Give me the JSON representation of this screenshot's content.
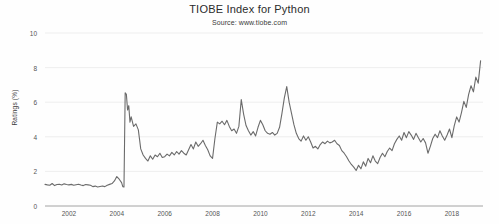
{
  "chart_data": {
    "type": "line",
    "title": "TIOBE Index for Python",
    "subtitle": "Source: www.tiobe.com",
    "xlabel": "",
    "ylabel": "Ratings (%)",
    "ylim": [
      0,
      10
    ],
    "xlim": [
      2001.0,
      2019.3
    ],
    "yticks": [
      0,
      2,
      4,
      6,
      8,
      10
    ],
    "ytick_labels": [
      "0",
      "2",
      "4",
      "6",
      "8",
      "10"
    ],
    "xticks": [
      2002,
      2004,
      2006,
      2008,
      2010,
      2012,
      2014,
      2016,
      2018
    ],
    "xtick_labels": [
      "2002",
      "2004",
      "2006",
      "2008",
      "2010",
      "2012",
      "2014",
      "2016",
      "2018"
    ],
    "grid": "horizontal",
    "legend": "none",
    "series": [
      {
        "name": "Python",
        "color": "#6b6b6b",
        "x": [
          2001.0,
          2001.1,
          2001.2,
          2001.3,
          2001.4,
          2001.5,
          2001.6,
          2001.7,
          2001.8,
          2001.9,
          2002.0,
          2002.1,
          2002.2,
          2002.3,
          2002.4,
          2002.5,
          2002.6,
          2002.7,
          2002.8,
          2002.9,
          2003.0,
          2003.1,
          2003.2,
          2003.3,
          2003.4,
          2003.5,
          2003.6,
          2003.7,
          2003.8,
          2003.9,
          2004.0,
          2004.1,
          2004.2,
          2004.25,
          2004.3,
          2004.35,
          2004.4,
          2004.45,
          2004.5,
          2004.55,
          2004.6,
          2004.7,
          2004.8,
          2004.9,
          2005.0,
          2005.1,
          2005.2,
          2005.3,
          2005.4,
          2005.5,
          2005.6,
          2005.7,
          2005.8,
          2005.9,
          2006.0,
          2006.1,
          2006.2,
          2006.3,
          2006.4,
          2006.5,
          2006.6,
          2006.7,
          2006.8,
          2006.9,
          2007.0,
          2007.1,
          2007.2,
          2007.3,
          2007.4,
          2007.5,
          2007.6,
          2007.7,
          2007.8,
          2007.9,
          2008.0,
          2008.1,
          2008.2,
          2008.3,
          2008.4,
          2008.5,
          2008.6,
          2008.7,
          2008.8,
          2008.9,
          2009.0,
          2009.1,
          2009.2,
          2009.3,
          2009.4,
          2009.5,
          2009.6,
          2009.7,
          2009.8,
          2009.9,
          2010.0,
          2010.1,
          2010.2,
          2010.3,
          2010.4,
          2010.5,
          2010.6,
          2010.7,
          2010.8,
          2010.9,
          2011.0,
          2011.1,
          2011.2,
          2011.3,
          2011.4,
          2011.5,
          2011.6,
          2011.7,
          2011.8,
          2011.9,
          2012.0,
          2012.1,
          2012.2,
          2012.3,
          2012.4,
          2012.5,
          2012.6,
          2012.7,
          2012.8,
          2012.9,
          2013.0,
          2013.1,
          2013.2,
          2013.3,
          2013.4,
          2013.5,
          2013.6,
          2013.7,
          2013.8,
          2013.9,
          2014.0,
          2014.1,
          2014.2,
          2014.3,
          2014.4,
          2014.5,
          2014.6,
          2014.7,
          2014.8,
          2014.9,
          2015.0,
          2015.1,
          2015.2,
          2015.3,
          2015.4,
          2015.5,
          2015.6,
          2015.7,
          2015.8,
          2015.9,
          2016.0,
          2016.1,
          2016.2,
          2016.3,
          2016.4,
          2016.5,
          2016.6,
          2016.7,
          2016.8,
          2016.9,
          2017.0,
          2017.1,
          2017.2,
          2017.3,
          2017.4,
          2017.5,
          2017.6,
          2017.7,
          2017.8,
          2017.9,
          2018.0,
          2018.1,
          2018.2,
          2018.3,
          2018.4,
          2018.5,
          2018.6,
          2018.7,
          2018.8,
          2018.9,
          2019.0,
          2019.1,
          2019.2
        ],
        "y": [
          1.25,
          1.22,
          1.2,
          1.3,
          1.18,
          1.24,
          1.26,
          1.21,
          1.28,
          1.24,
          1.22,
          1.25,
          1.2,
          1.23,
          1.26,
          1.21,
          1.18,
          1.24,
          1.22,
          1.2,
          1.12,
          1.15,
          1.1,
          1.13,
          1.16,
          1.12,
          1.2,
          1.25,
          1.3,
          1.45,
          1.7,
          1.55,
          1.35,
          1.12,
          1.1,
          6.55,
          6.45,
          5.55,
          5.8,
          4.85,
          5.15,
          4.6,
          4.75,
          4.4,
          3.3,
          2.95,
          2.75,
          2.6,
          2.9,
          2.7,
          2.95,
          2.85,
          3.05,
          2.8,
          2.85,
          3.0,
          2.9,
          3.1,
          2.95,
          3.15,
          3.0,
          3.2,
          3.05,
          2.95,
          3.25,
          3.55,
          3.3,
          3.7,
          3.45,
          3.6,
          3.8,
          3.5,
          3.25,
          2.9,
          2.75,
          3.9,
          4.85,
          4.75,
          4.9,
          4.7,
          4.95,
          4.6,
          4.35,
          4.45,
          4.2,
          4.6,
          6.15,
          5.3,
          4.65,
          4.35,
          4.1,
          4.3,
          4.05,
          4.55,
          4.95,
          4.7,
          4.35,
          4.2,
          4.15,
          4.25,
          4.1,
          4.2,
          4.55,
          5.35,
          6.25,
          6.9,
          6.0,
          5.35,
          4.7,
          4.2,
          3.9,
          3.75,
          4.05,
          3.8,
          4.0,
          3.7,
          3.35,
          3.45,
          3.3,
          3.55,
          3.7,
          3.6,
          3.75,
          3.65,
          3.7,
          3.8,
          3.6,
          3.5,
          3.2,
          3.05,
          2.85,
          2.6,
          2.4,
          2.25,
          2.05,
          2.35,
          2.15,
          2.55,
          2.3,
          2.75,
          2.5,
          2.9,
          2.6,
          2.45,
          2.8,
          3.05,
          2.85,
          3.15,
          3.35,
          3.2,
          3.6,
          3.85,
          4.05,
          3.8,
          4.25,
          3.95,
          4.3,
          4.1,
          3.85,
          4.2,
          3.95,
          3.7,
          3.9,
          3.65,
          3.05,
          3.45,
          3.9,
          4.15,
          3.95,
          4.35,
          4.05,
          3.8,
          4.1,
          4.45,
          3.95,
          4.65,
          5.15,
          4.85,
          5.4,
          6.05,
          5.7,
          6.45,
          6.95,
          6.6,
          7.45,
          7.1,
          8.4
        ]
      }
    ]
  },
  "axis": {
    "y_title": "Ratings (%)"
  }
}
